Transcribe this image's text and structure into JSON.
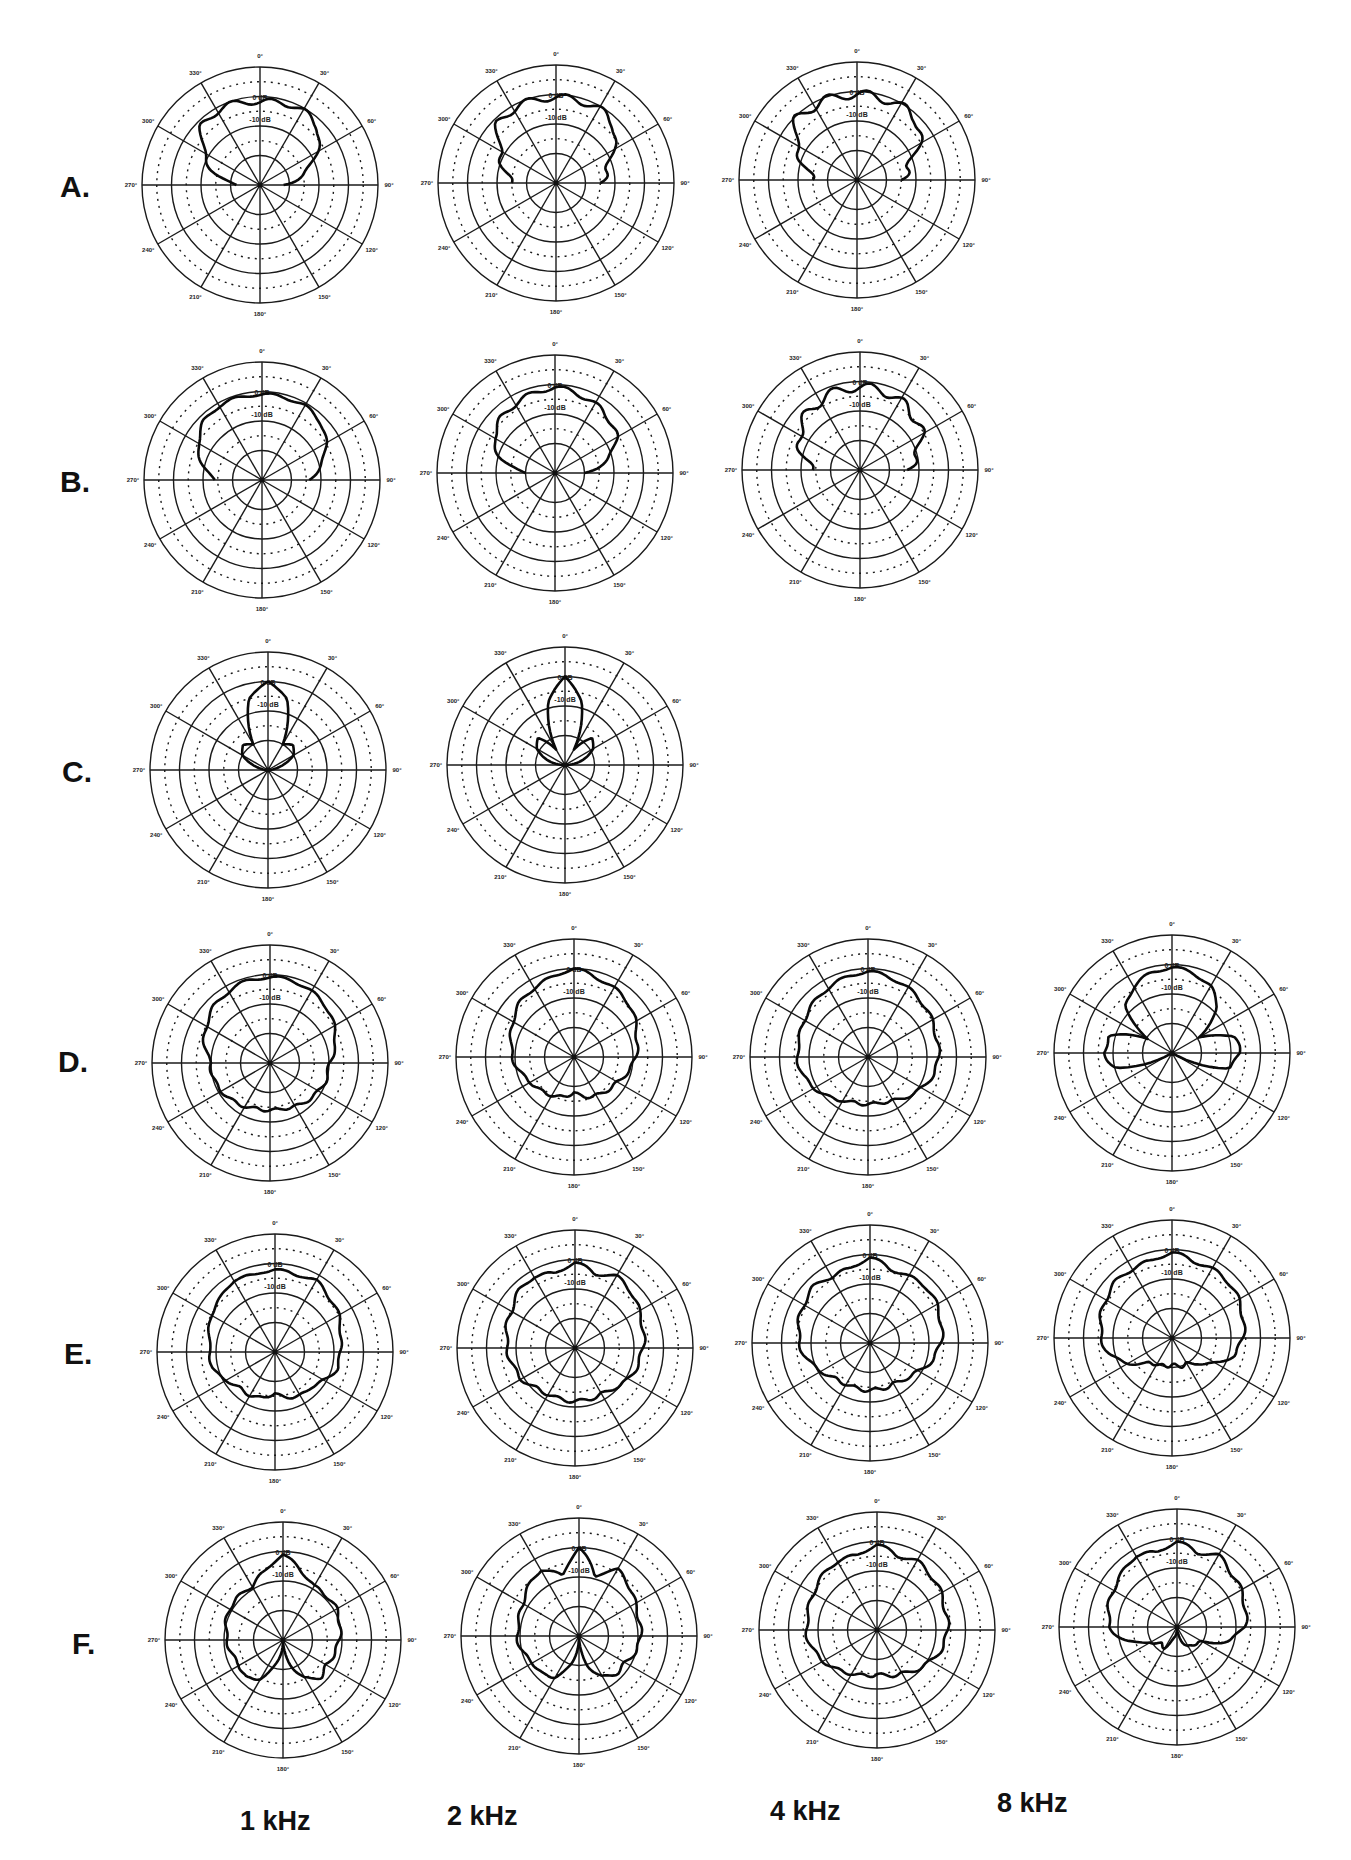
{
  "figure": {
    "row_labels": [
      "A.",
      "B.",
      "C.",
      "D.",
      "E.",
      "F."
    ],
    "frequency_labels": [
      "1 kHz",
      "2 kHz",
      "4 kHz",
      "8 kHz"
    ],
    "angle_labels": [
      "0°",
      "30°",
      "60°",
      "90°",
      "120°",
      "150°",
      "180°",
      "210°",
      "240°",
      "270°",
      "300°",
      "330°"
    ],
    "db_labels": [
      "0 dB",
      "-10 dB"
    ]
  },
  "chart_data": {
    "type": "polar",
    "title": "",
    "radial_axis": {
      "unit": "dB",
      "ring_step_db": 5,
      "range": [
        -30,
        10
      ],
      "labeled": [
        "0 dB",
        "-10 dB"
      ]
    },
    "angular_axis": {
      "step_deg": 30,
      "ticks": [
        0,
        30,
        60,
        90,
        120,
        150,
        180,
        210,
        240,
        270,
        300,
        330
      ],
      "zero_at": "top",
      "direction": "clockwise"
    },
    "angles_deg": [
      0,
      15,
      30,
      45,
      60,
      75,
      90,
      105,
      120,
      135,
      150,
      165,
      180
    ],
    "note": "values symmetric about 0°; listed 0→180°, null = no trace (pattern truncated at 90°)",
    "plots": [
      {
        "row": "A",
        "freq": "1 kHz",
        "db": [
          -2,
          -1,
          -1,
          -2,
          -8,
          -14,
          -22,
          null,
          null,
          null,
          null,
          null,
          null
        ],
        "ripple": 1.0
      },
      {
        "row": "A",
        "freq": "2 kHz",
        "db": [
          -1,
          -1,
          -1,
          -2,
          -8,
          -12,
          -15,
          null,
          null,
          null,
          null,
          null,
          null
        ],
        "ripple": 1.2
      },
      {
        "row": "A",
        "freq": "4 kHz",
        "db": [
          -1,
          -1,
          -1,
          -1,
          -6,
          -12,
          -15,
          null,
          null,
          null,
          null,
          null,
          null
        ],
        "ripple": 1.5
      },
      {
        "row": "B",
        "freq": "1 kHz",
        "db": [
          -1,
          -1,
          -1,
          -2,
          -5,
          -9,
          -14,
          null,
          null,
          null,
          null,
          null,
          null
        ],
        "ripple": 0.5
      },
      {
        "row": "B",
        "freq": "2 kHz",
        "db": [
          -1,
          -2,
          -3,
          -4,
          -6,
          -11,
          -20,
          null,
          null,
          null,
          null,
          null,
          null
        ],
        "ripple": 0.8
      },
      {
        "row": "B",
        "freq": "4 kHz",
        "db": [
          -2,
          -2,
          -3,
          -4,
          -6,
          -10,
          -14,
          null,
          null,
          null,
          null,
          null,
          null
        ],
        "ripple": 1.5
      },
      {
        "row": "C",
        "freq": "1 kHz",
        "db": [
          0,
          -5,
          -20,
          -18,
          -20,
          -26,
          -30,
          null,
          null,
          null,
          null,
          null,
          null
        ],
        "ripple": 0
      },
      {
        "row": "C",
        "freq": "2 kHz",
        "db": [
          0,
          -8,
          -24,
          -17,
          -19,
          -24,
          -30,
          null,
          null,
          null,
          null,
          null,
          null
        ],
        "ripple": 0
      },
      {
        "row": "D",
        "freq": "1 kHz",
        "db": [
          -1,
          -1,
          -2,
          -3,
          -5,
          -7,
          -10,
          -10,
          -11,
          -12,
          -13,
          -14,
          -14
        ],
        "ripple": 0.5
      },
      {
        "row": "D",
        "freq": "2 kHz",
        "db": [
          0,
          -2,
          -3,
          -4,
          -6,
          -8,
          -9,
          -11,
          -13,
          -14,
          -15,
          -16,
          -18
        ],
        "ripple": 0.5
      },
      {
        "row": "D",
        "freq": "4 kHz",
        "db": [
          -1,
          -2,
          -3,
          -4,
          -5,
          -6,
          -6,
          -7,
          -9,
          -11,
          -13,
          -14,
          -14
        ],
        "ripple": 0.5
      },
      {
        "row": "D",
        "freq": "8 kHz",
        "db": [
          -1,
          -2,
          -4,
          -8,
          -20,
          -8,
          -7,
          -10,
          -30,
          -30,
          -30,
          -30,
          -30
        ],
        "ripple": 0.5
      },
      {
        "row": "E",
        "freq": "1 kHz",
        "db": [
          -2,
          -3,
          -2,
          -4,
          -5,
          -7,
          -8,
          -8,
          -11,
          -13,
          -13,
          -14,
          -16
        ],
        "ripple": 0.4
      },
      {
        "row": "E",
        "freq": "2 kHz",
        "db": [
          -1,
          -4,
          -2,
          -3,
          -5,
          -6,
          -7,
          -8,
          -9,
          -11,
          -12,
          -12,
          -12
        ],
        "ripple": 0.6
      },
      {
        "row": "E",
        "freq": "4 kHz",
        "db": [
          -1,
          -4,
          -4,
          -3,
          -4,
          -5,
          -6,
          -8,
          -11,
          -13,
          -14,
          -14,
          -14
        ],
        "ripple": 0.6
      },
      {
        "row": "E",
        "freq": "8 kHz",
        "db": [
          -1,
          -3,
          -3,
          -3,
          -4,
          -5,
          -6,
          -8,
          -13,
          -18,
          -20,
          -20,
          -21
        ],
        "ripple": 0.6
      },
      {
        "row": "F",
        "freq": "1 kHz",
        "db": [
          -1,
          -6,
          -9,
          -9,
          -9,
          -10,
          -11,
          -12,
          -13,
          -12,
          -15,
          -22,
          -30
        ],
        "ripple": 0.5
      },
      {
        "row": "F",
        "freq": "2 kHz",
        "db": [
          0,
          -9,
          -4,
          -6,
          -8,
          -9,
          -9,
          -10,
          -12,
          -12,
          -14,
          -20,
          -30
        ],
        "ripple": 0.5
      },
      {
        "row": "F",
        "freq": "4 kHz",
        "db": [
          -1,
          -4,
          -3,
          -4,
          -5,
          -6,
          -6,
          -7,
          -9,
          -11,
          -13,
          -14,
          -15
        ],
        "ripple": 0.6
      },
      {
        "row": "F",
        "freq": "8 kHz",
        "db": [
          -1,
          -4,
          -2,
          -4,
          -5,
          -6,
          -7,
          -12,
          -20,
          -22,
          -22,
          -26,
          -30
        ],
        "ripple": 0.6
      }
    ]
  },
  "layout": {
    "radius": 118,
    "rows": [
      {
        "label_xy": [
          60,
          197
        ],
        "centers": [
          [
            260,
            185
          ],
          [
            556,
            183
          ],
          [
            857,
            180
          ]
        ]
      },
      {
        "label_xy": [
          60,
          492
        ],
        "centers": [
          [
            262,
            480
          ],
          [
            555,
            473
          ],
          [
            860,
            470
          ]
        ]
      },
      {
        "label_xy": [
          62,
          782
        ],
        "centers": [
          [
            268,
            770
          ],
          [
            565,
            765
          ]
        ]
      },
      {
        "label_xy": [
          58,
          1072
        ],
        "centers": [
          [
            270,
            1063
          ],
          [
            574,
            1057
          ],
          [
            868,
            1057
          ],
          [
            1172,
            1053
          ]
        ]
      },
      {
        "label_xy": [
          64,
          1364
        ],
        "centers": [
          [
            275,
            1352
          ],
          [
            575,
            1348
          ],
          [
            870,
            1343
          ],
          [
            1172,
            1338
          ]
        ]
      },
      {
        "label_xy": [
          72,
          1654
        ],
        "centers": [
          [
            283,
            1640
          ],
          [
            579,
            1636
          ],
          [
            877,
            1630
          ],
          [
            1177,
            1627
          ]
        ]
      }
    ],
    "freq_label_xy": [
      [
        240,
        1830
      ],
      [
        447,
        1825
      ],
      [
        770,
        1820
      ],
      [
        997,
        1812
      ]
    ]
  }
}
